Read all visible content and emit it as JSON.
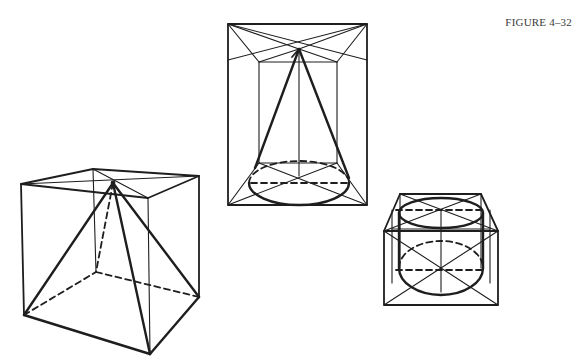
{
  "figure": {
    "caption": "FIGURE 4–32",
    "shapes": [
      {
        "id": "pyramid-in-cube",
        "label": "Pyramid in cube"
      },
      {
        "id": "cone-in-box",
        "label": "Cone in box"
      },
      {
        "id": "cylinder-in-box",
        "label": "Cylinder in box"
      }
    ],
    "colors": {
      "line": "#1e1e1e",
      "background": "#ffffff"
    }
  }
}
